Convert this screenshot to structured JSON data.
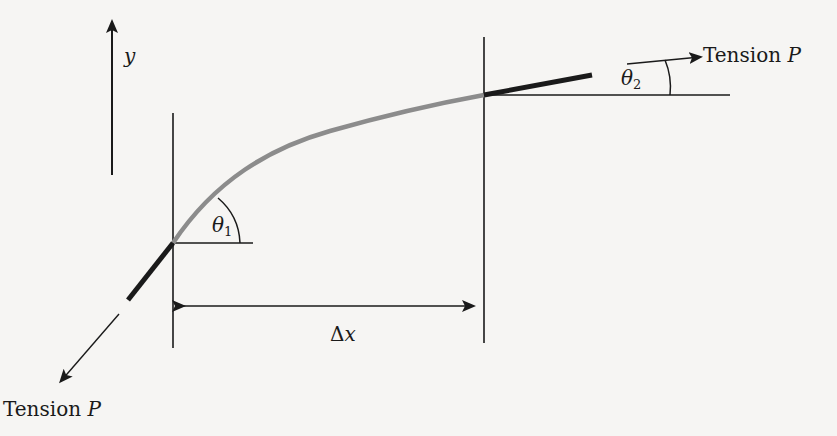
{
  "diagram": {
    "type": "physics-free-body",
    "labels": {
      "y_axis": "y",
      "tension_top": {
        "word": "Tension",
        "symbol": "P"
      },
      "tension_bottom": {
        "word": "Tension",
        "symbol": "P"
      },
      "theta1": {
        "symbol": "θ",
        "subscript": "1"
      },
      "theta2": {
        "symbol": "θ",
        "subscript": "2"
      },
      "delta_x": {
        "symbol": "Δ",
        "var": "x"
      }
    },
    "colors": {
      "background": "#f6f5f3",
      "ink": "#1a1a1a",
      "curve": "#8c8c8c"
    }
  }
}
